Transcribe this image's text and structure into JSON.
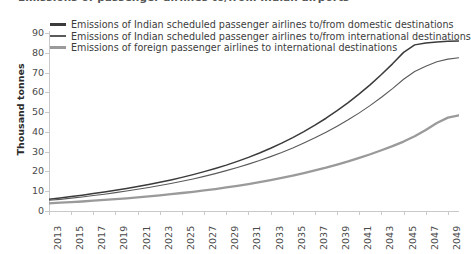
{
  "title_clipped": "Emissions of passenger airlines to/from Indian airports",
  "legend": {
    "position": "top-left-inside",
    "items": [
      {
        "label": "Emissions of Indian scheduled passenger airlines to/from domestic destinations",
        "color": "#3b3b3b",
        "swatch_name": "legend-swatch-domestic"
      },
      {
        "label": "Emissions of Indian scheduled passenger airlines to/from international destinations",
        "color": "#5a5a5a",
        "swatch_name": "legend-swatch-international"
      },
      {
        "label": "Emissions of foreign passenger airlines to international destinations",
        "color": "#9a9a9a",
        "swatch_name": "legend-swatch-foreign"
      }
    ]
  },
  "axes": {
    "ylabel": "Thousand tonnes",
    "xlabel": "",
    "y_ticks": [
      0,
      10,
      20,
      30,
      40,
      50,
      60,
      70,
      80,
      90
    ],
    "ylim": [
      0,
      90
    ],
    "x_tick_labels": [
      "2013",
      "2015",
      "2017",
      "2019",
      "2021",
      "2023",
      "2025",
      "2027",
      "2029",
      "2031",
      "2033",
      "2035",
      "2037",
      "2039",
      "2041",
      "2043",
      "2045",
      "2047",
      "2049"
    ],
    "xlim": [
      2013,
      2050
    ],
    "grid": false
  },
  "chart_data": {
    "type": "line",
    "title": "Emissions of passenger airlines to/from Indian airports",
    "xlabel": "",
    "ylabel": "Thousand tonnes",
    "ylim": [
      0,
      90
    ],
    "xlim": [
      2013,
      2050
    ],
    "grid": false,
    "legend_position": "top-left-inside",
    "x": [
      2013,
      2014,
      2015,
      2016,
      2017,
      2018,
      2019,
      2020,
      2021,
      2022,
      2023,
      2024,
      2025,
      2026,
      2027,
      2028,
      2029,
      2030,
      2031,
      2032,
      2033,
      2034,
      2035,
      2036,
      2037,
      2038,
      2039,
      2040,
      2041,
      2042,
      2043,
      2044,
      2045,
      2046,
      2047,
      2048,
      2049,
      2050
    ],
    "series": [
      {
        "name": "Emissions of Indian scheduled passenger airlines to/from domestic destinations",
        "color": "#3b3b3b",
        "values": [
          6.0,
          6.6,
          7.3,
          8.0,
          8.8,
          9.6,
          10.5,
          11.4,
          12.4,
          13.4,
          14.5,
          15.7,
          17.0,
          18.4,
          19.9,
          21.5,
          23.2,
          25.1,
          27.1,
          29.3,
          31.7,
          34.3,
          37.1,
          40.1,
          43.4,
          46.9,
          50.7,
          54.8,
          59.2,
          63.9,
          69.0,
          74.4,
          80.2,
          84.0,
          85.0,
          85.5,
          85.8,
          86.0
        ]
      },
      {
        "name": "Emissions of Indian scheduled passenger airlines to/from international destinations",
        "color": "#5a5a5a",
        "values": [
          5.4,
          5.9,
          6.5,
          7.1,
          7.8,
          8.5,
          9.3,
          10.1,
          11.0,
          11.9,
          12.9,
          13.9,
          15.0,
          16.2,
          17.5,
          18.9,
          20.4,
          22.0,
          23.7,
          25.5,
          27.5,
          29.6,
          31.9,
          34.4,
          37.0,
          39.8,
          42.9,
          46.1,
          49.6,
          53.4,
          57.5,
          61.9,
          66.6,
          70.5,
          73.2,
          75.5,
          76.8,
          77.5
        ]
      },
      {
        "name": "Emissions of foreign passenger airlines to international destinations",
        "color": "#9a9a9a",
        "values": [
          3.9,
          4.2,
          4.5,
          4.8,
          5.2,
          5.6,
          6.0,
          6.4,
          6.9,
          7.4,
          7.9,
          8.5,
          9.1,
          9.7,
          10.4,
          11.1,
          11.9,
          12.7,
          13.6,
          14.6,
          15.6,
          16.7,
          17.9,
          19.2,
          20.5,
          21.9,
          23.5,
          25.1,
          26.9,
          28.7,
          30.7,
          32.8,
          35.1,
          37.8,
          41.0,
          44.5,
          47.2,
          48.4
        ]
      }
    ]
  }
}
